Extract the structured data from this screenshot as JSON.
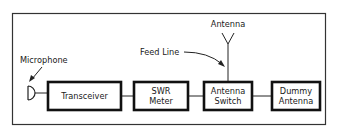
{
  "diagram": {
    "blocks": [
      {
        "id": "transceiver",
        "label_lines": [
          "Transceiver"
        ]
      },
      {
        "id": "swr-meter",
        "label_lines": [
          "SWR",
          "Meter"
        ]
      },
      {
        "id": "antenna-switch",
        "label_lines": [
          "Antenna",
          "Switch"
        ]
      },
      {
        "id": "dummy-antenna",
        "label_lines": [
          "Dummy",
          "Antenna"
        ]
      }
    ],
    "callouts": {
      "microphone": "Microphone",
      "feed_line": "Feed Line",
      "antenna": "Antenna"
    },
    "connections": [
      [
        "microphone",
        "transceiver"
      ],
      [
        "transceiver",
        "swr-meter"
      ],
      [
        "swr-meter",
        "antenna-switch"
      ],
      [
        "antenna-switch",
        "dummy-antenna"
      ],
      [
        "antenna-switch",
        "antenna"
      ]
    ],
    "colors": {
      "stroke": "#111111",
      "background": "#ffffff"
    }
  }
}
